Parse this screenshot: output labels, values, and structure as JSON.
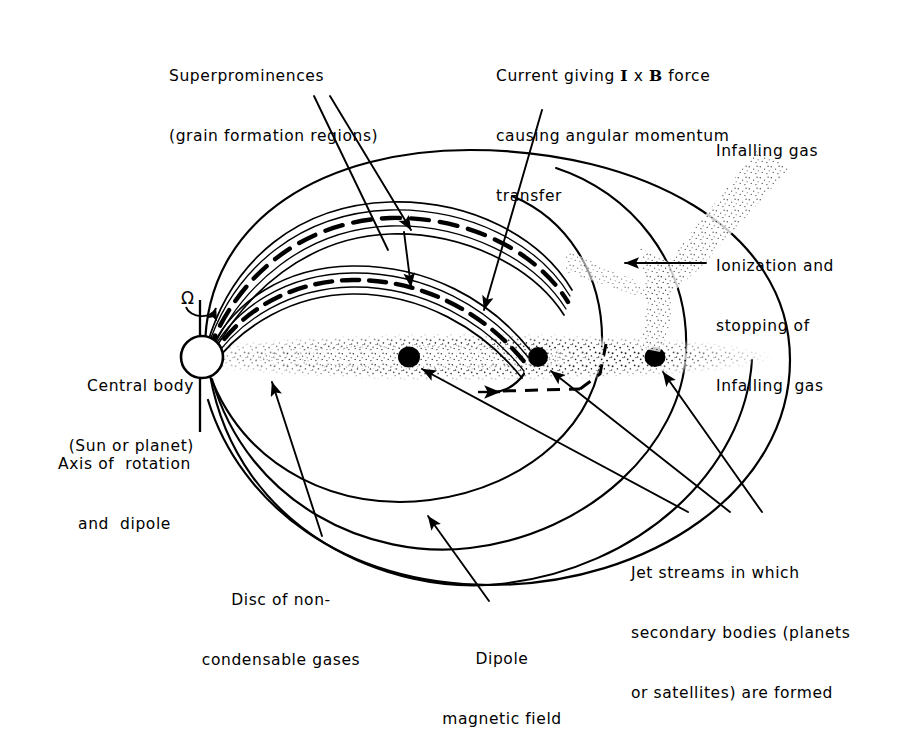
{
  "figure": {
    "type": "schematic-diagram",
    "background_color": "#ffffff",
    "ink_color": "#000000"
  },
  "labels": {
    "superprominences": {
      "line1": "Superprominences",
      "line2": "(grain formation regions)"
    },
    "current": {
      "line1_pre": "Current giving ",
      "line1_I": "I",
      "line1_mid": " x ",
      "line1_B": "B",
      "line1_post": " force",
      "line2": "causing angular momentum",
      "line3": "transfer"
    },
    "infalling_gas": "Infalling gas",
    "ionization": {
      "line1": "Ionization and",
      "line2": "stopping of",
      "line3": "Infalling  gas"
    },
    "central_body": {
      "line1": "Central body",
      "line2": "(Sun or planet)"
    },
    "axis": {
      "line1": "Axis of  rotation",
      "line2": "and  dipole"
    },
    "disc": {
      "line1": "Disc of non-",
      "line2": "condensable gases"
    },
    "dipole_field": {
      "line1": "Dipole",
      "line2": "magnetic field"
    },
    "jet_streams": {
      "line1": "Jet streams in which",
      "line2": "secondary bodies (planets",
      "line3": "or satellites) are formed"
    },
    "omega_symbol": "Ω"
  },
  "elements": {
    "central_body_icon": "circle-central-body",
    "rotation_arrow_icon": "curved-rotation-arrow-icon",
    "secondary_bodies_count": 3,
    "superprominence_arcs_count": 2,
    "dipole_field_lines_count": 3,
    "pointer_arrows_icon": "leader-arrow-icon",
    "current_path_icon": "dashed-current-path-icon",
    "infalling_gas_icon": "stippled-gas-stream-icon",
    "disc_icon": "stippled-disc-band-icon"
  }
}
